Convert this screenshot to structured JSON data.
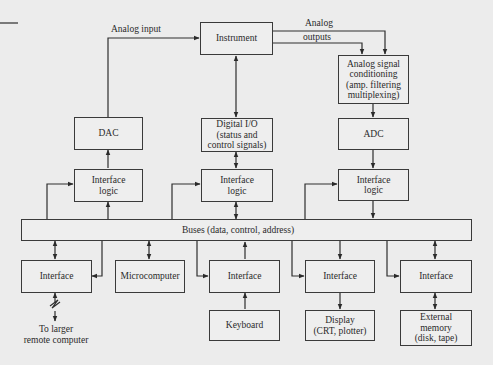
{
  "diagram": {
    "type": "block-diagram",
    "nodes": {
      "instrument": {
        "label": "Instrument"
      },
      "dac": {
        "label": "DAC"
      },
      "digital_io": {
        "lines": [
          "Digital I/O",
          "(status and",
          "control signals)"
        ]
      },
      "analog_cond": {
        "lines": [
          "Analog signal",
          "conditioning",
          "(amp. filtering",
          "multiplexing)"
        ]
      },
      "adc": {
        "label": "ADC"
      },
      "if_logic_left": {
        "lines": [
          "Interface",
          "logic"
        ]
      },
      "if_logic_mid": {
        "lines": [
          "Interface",
          "logic"
        ]
      },
      "if_logic_right": {
        "lines": [
          "Interface",
          "logic"
        ]
      },
      "bus": {
        "label": "Buses (data, control, address)"
      },
      "interface_1": {
        "label": "Interface"
      },
      "microcomputer": {
        "label": "Microcomputer"
      },
      "interface_3": {
        "label": "Interface"
      },
      "interface_4": {
        "label": "Interface"
      },
      "interface_5": {
        "label": "Interface"
      },
      "keyboard": {
        "label": "Keyboard"
      },
      "display": {
        "lines": [
          "Display",
          "(CRT, plotter)"
        ]
      },
      "ext_memory": {
        "lines": [
          "External",
          "memory",
          "(disk, tape)"
        ]
      },
      "remote": {
        "lines": [
          "To larger",
          "remote computer"
        ]
      }
    },
    "edge_labels": {
      "analog_input": "Analog input",
      "analog_outputs_1": "Analog",
      "analog_outputs_2": "outputs"
    },
    "edges": [
      {
        "from": "dac",
        "to": "instrument",
        "label": "Analog input",
        "dir": "forward"
      },
      {
        "from": "instrument",
        "to": "analog_cond",
        "label": "Analog outputs",
        "dir": "forward",
        "count": 2
      },
      {
        "from": "instrument",
        "to": "digital_io",
        "dir": "both"
      },
      {
        "from": "analog_cond",
        "to": "adc",
        "dir": "forward"
      },
      {
        "from": "if_logic_left",
        "to": "dac",
        "dir": "forward"
      },
      {
        "from": "digital_io",
        "to": "if_logic_mid",
        "dir": "both"
      },
      {
        "from": "adc",
        "to": "if_logic_right",
        "dir": "forward"
      },
      {
        "from": "bus",
        "to": "if_logic_left",
        "dir": "forward",
        "count": 2
      },
      {
        "from": "bus",
        "to": "if_logic_mid",
        "dir": "both"
      },
      {
        "from": "bus",
        "to": "if_logic_mid",
        "dir": "forward"
      },
      {
        "from": "if_logic_right",
        "to": "bus",
        "dir": "forward"
      },
      {
        "from": "bus",
        "to": "if_logic_right",
        "dir": "forward"
      },
      {
        "from": "bus",
        "to": "interface_1",
        "dir": "both"
      },
      {
        "from": "bus",
        "to": "interface_1",
        "dir": "forward"
      },
      {
        "from": "bus",
        "to": "microcomputer",
        "dir": "both"
      },
      {
        "from": "interface_3",
        "to": "bus",
        "dir": "forward"
      },
      {
        "from": "bus",
        "to": "interface_3",
        "dir": "forward"
      },
      {
        "from": "bus",
        "to": "interface_4",
        "dir": "forward",
        "count": 2
      },
      {
        "from": "bus",
        "to": "interface_5",
        "dir": "both"
      },
      {
        "from": "bus",
        "to": "interface_5",
        "dir": "forward"
      },
      {
        "from": "interface_1",
        "to": "remote",
        "dir": "both",
        "style": "broken"
      },
      {
        "from": "keyboard",
        "to": "interface_3",
        "dir": "forward"
      },
      {
        "from": "interface_4",
        "to": "display",
        "dir": "forward"
      },
      {
        "from": "interface_5",
        "to": "ext_memory",
        "dir": "both"
      }
    ]
  }
}
